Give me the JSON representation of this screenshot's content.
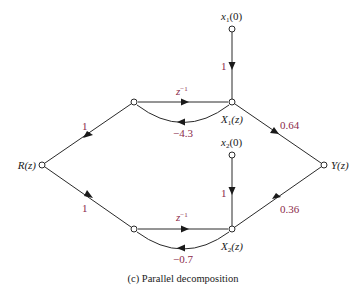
{
  "diagram": {
    "caption": "(c)  Parallel decomposition",
    "colors": {
      "gain": "#8b2a4a",
      "line": "#2a2a2a"
    },
    "nodes": {
      "input": {
        "label": "R(z)"
      },
      "output": {
        "label": "Y(z)"
      },
      "x1": {
        "label": "X",
        "sub": "1",
        "tail": "(z)"
      },
      "x2": {
        "label": "X",
        "sub": "2",
        "tail": "(z)"
      },
      "x1_init": {
        "label": "x",
        "sub": "1",
        "tail": "(0)"
      },
      "x2_init": {
        "label": "x",
        "sub": "2",
        "tail": "(0)"
      }
    },
    "gains": {
      "r_to_upper": "1",
      "r_to_lower": "1",
      "upper_delay": "z",
      "upper_delay_exp": "−1",
      "upper_feedback": "−4.3",
      "x1_init": "1",
      "x1_to_y": "0.64",
      "lower_delay": "z",
      "lower_delay_exp": "−1",
      "lower_feedback": "−0.7",
      "x2_init": "1",
      "x2_to_y": "0.36"
    }
  }
}
